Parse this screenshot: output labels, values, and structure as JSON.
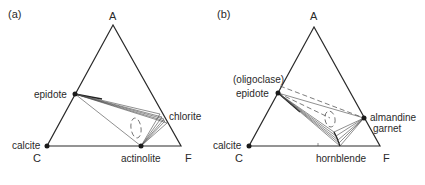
{
  "panels": [
    {
      "id": "a",
      "panel_label": "(a)",
      "vertices": {
        "top": "A",
        "left": "C",
        "right": "F"
      },
      "minerals": {
        "epidote": "epidote",
        "chlorite": "chlorite",
        "calcite": "calcite",
        "actinolite": "actinolite"
      }
    },
    {
      "id": "b",
      "panel_label": "(b)",
      "vertices": {
        "top": "A",
        "left": "C",
        "right": "F"
      },
      "minerals": {
        "oligoclase": "(oligoclase)",
        "epidote": "epidote",
        "almandine_line1": "almandine",
        "almandine_line2": "garnet",
        "calcite": "calcite",
        "hornblende": "hornblende"
      }
    }
  ]
}
